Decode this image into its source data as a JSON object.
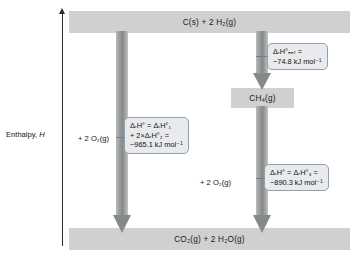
{
  "diagram": {
    "type": "enthalpy-level-diagram",
    "axis": {
      "label": "Enthalpy, H",
      "label_text": "Enthalpy,",
      "label_variable": "H",
      "direction": "up"
    },
    "species": {
      "reactants": "C(s) + 2 H₂(g)",
      "reactants_parts": {
        "formula1": "C(s)",
        "plus": "+",
        "coefficient": "2",
        "formula2": "H₂(g)"
      },
      "intermediate": "CH₄(g)",
      "products": "CO₂(g) + 2 H₂O(g)",
      "products_parts": {
        "formula1": "CO₂(g)",
        "plus": "+",
        "coefficient": "2",
        "formula2": "H₂O(g)"
      }
    },
    "added_reagents": {
      "left_branch": "+ 2 O₂(g)",
      "right_branch": "+ 2 O₂(g)"
    },
    "callouts": {
      "formation_ch4": {
        "line1": "ΔᵣH°ₙₑₜ =",
        "line2": "−74.8 kJ mol⁻¹",
        "symbol": "Δ",
        "subscript_r": "r",
        "variable": "H",
        "degree": "°",
        "subscript_net": "net",
        "equals": "=",
        "value": "−74.8",
        "units": "kJ mol⁻¹"
      },
      "combined_combustion": {
        "line1": "ΔᵣH° = ΔᵣH°₁",
        "line2": "+ 2×ΔᵣH°₂ =",
        "line3": "−965.1 kJ mol⁻¹",
        "value": "−965.1",
        "units": "kJ mol⁻¹",
        "term1_index": "1",
        "term2_index": "2",
        "multiplier": "2"
      },
      "methane_combustion": {
        "line1": "ΔᵣH° = ΔᵣH°₃ =",
        "line2": "−890.3 kJ mol⁻¹",
        "value": "−890.3",
        "units": "kJ mol⁻¹",
        "term_index": "3"
      }
    },
    "colors": {
      "bar_fill": "#cfd0cf",
      "arrow_gray": "#8b8f8e",
      "callout_fill": "#e9eaec",
      "callout_border": "#8f9fb5",
      "axis": "#2b2b2b",
      "background": "#ffffff"
    }
  }
}
